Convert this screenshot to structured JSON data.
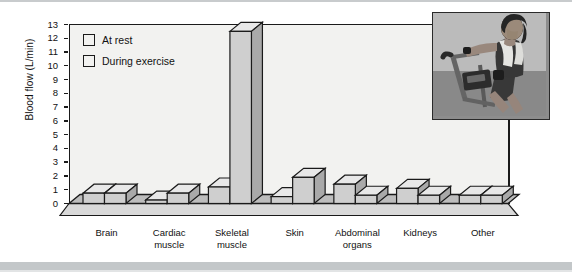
{
  "chart_data": {
    "type": "bar",
    "title": "",
    "subtitle": "",
    "xlabel": "",
    "ylabel": "Blood flow (L/min)",
    "ylim": [
      0,
      13
    ],
    "yticks": [
      0,
      1,
      2,
      3,
      4,
      5,
      6,
      7,
      8,
      9,
      10,
      11,
      12,
      13
    ],
    "grid": false,
    "legend_position": "inside-top-left",
    "categories": [
      "Brain",
      "Cardiac muscle",
      "Skeletal muscle",
      "Skin",
      "Abdominal organs",
      "Kidneys",
      "Other"
    ],
    "category_lines": [
      [
        "Brain"
      ],
      [
        "Cardiac",
        "muscle"
      ],
      [
        "Skeletal",
        "muscle"
      ],
      [
        "Skin"
      ],
      [
        "Abdominal",
        "organs"
      ],
      [
        "Kidneys"
      ],
      [
        "Other"
      ]
    ],
    "series": [
      {
        "name": "At rest",
        "color": "#cfcfcf",
        "values": [
          0.75,
          0.25,
          1.2,
          0.5,
          1.4,
          1.1,
          0.6
        ]
      },
      {
        "name": "During exercise",
        "color": "#cfcfcf",
        "values": [
          0.75,
          0.75,
          12.5,
          1.9,
          0.6,
          0.6,
          0.6
        ]
      }
    ],
    "style": {
      "bar_face": "#cfcfcf",
      "bar_top": "#e8e8e8",
      "bar_side": "#a9a9a9",
      "outline": "#1a1a1a",
      "plot_background": "#f2f2f0",
      "floor": "#bdbdbd",
      "page_background": "#ffffff"
    }
  },
  "legend": {
    "items": [
      {
        "label": "At rest",
        "swatch": "#cfcfcf"
      },
      {
        "label": "During exercise",
        "swatch": "#cfcfcf"
      }
    ]
  },
  "axis": {
    "y_title": "Blood flow (L/min)",
    "y_tick_labels": [
      "13",
      "12",
      "11",
      "10",
      "9",
      "8",
      "7",
      "6",
      "5",
      "4",
      "3",
      "2",
      "1",
      "0"
    ]
  },
  "photo": {
    "alt_name": "woman-exercising-on-stationary-bike",
    "description": "Grayscale photograph of a woman with a towel around her neck riding a stationary exercise bike"
  }
}
